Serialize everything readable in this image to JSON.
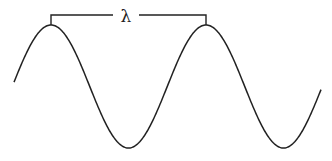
{
  "diagram": {
    "label": "λ",
    "label_meaning": "wavelength",
    "wave": {
      "x_start": 14,
      "x_end": 321,
      "center_y": 86.5,
      "amplitude": 61.5,
      "period": 155,
      "first_peak_x": 51
    },
    "bracket": {
      "x1": 51,
      "x2": 206,
      "y_top": 15,
      "y_bottom": 25,
      "gap_x1": 113,
      "gap_x2": 139
    },
    "colors": {
      "stroke": "#222222",
      "background": "#ffffff"
    }
  }
}
